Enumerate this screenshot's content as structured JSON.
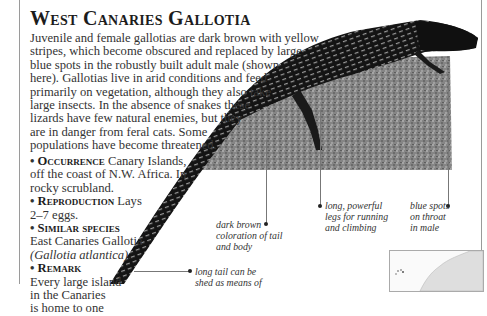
{
  "title": "West Canaries Gallotia",
  "body": {
    "lines": [
      "Juvenile and female gallotias are dark brown with yellow",
      "stripes, which become obscured and replaced by large",
      "blue spots in the robustly built adult male (shown",
      "here). Gallotias live in arid conditions and feed",
      "primarily on vegetation, although they also take",
      "large insects. In the absence of snakes these",
      "lizards have few natural enemies, but they",
      "are in danger from feral cats. Some",
      "populations have become threatened."
    ]
  },
  "facts": [
    {
      "heading": "Occurrence",
      "lines": [
        "Canary Islands,",
        "off the coast of N.W. Africa. In",
        "rocky scrubland."
      ]
    },
    {
      "heading": "Reproduction",
      "lines": [
        "Lays",
        "2–7 eggs."
      ]
    },
    {
      "heading": "Similar species",
      "lines": [
        "",
        "East Canaries Gallotia",
        "(Gallotia atlantica)."
      ]
    },
    {
      "heading": "Remark",
      "lines": [
        "",
        "Every large island",
        "in the Canaries",
        "is home to one"
      ]
    }
  ],
  "callouts": {
    "dark_brown": [
      "dark brown",
      "coloration of tail",
      "and body"
    ],
    "legs": [
      "long, powerful",
      "legs for running",
      "and climbing"
    ],
    "blue_spots": [
      "blue spots",
      "on throat",
      "in male"
    ],
    "tail": [
      "long tail can be",
      "shed as means of"
    ]
  },
  "colors": {
    "text": "#333333",
    "title": "#1c1c1c",
    "rule": "#9a9a9a",
    "rock": "#8a8a8a",
    "lizard": "#1a1a1a"
  }
}
